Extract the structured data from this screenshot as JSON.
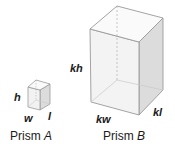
{
  "prism_a": {
    "caption_prefix": "Prism ",
    "caption_letter": "A",
    "labels": {
      "height": "h",
      "width": "w",
      "length": "l"
    }
  },
  "prism_b": {
    "caption_prefix": "Prism ",
    "caption_letter": "B",
    "labels": {
      "height": "kh",
      "width": "kw",
      "length": "kl"
    }
  },
  "colors": {
    "edge": "#9a9a9a",
    "front_face": "#f4f4f4",
    "side_face": "#dcdcdc",
    "top_face": "#fafafa",
    "text": "#1a1a1a"
  }
}
